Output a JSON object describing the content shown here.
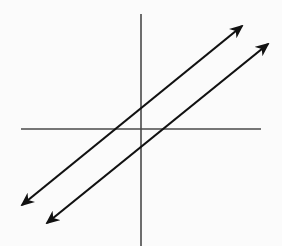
{
  "diagram": {
    "title": "Two parallel lines on coordinate axes",
    "colors": {
      "background": "#fbfbfb",
      "axis": "#4a4a4a",
      "line": "#111111"
    },
    "axes": {
      "x_axis": {
        "x1": 21,
        "y1": 129,
        "x2": 261,
        "y2": 129
      },
      "y_axis": {
        "x1": 141,
        "y1": 14,
        "x2": 141,
        "y2": 246
      }
    },
    "lines": [
      {
        "name": "line-a",
        "x1": 22,
        "y1": 205,
        "x2": 242,
        "y2": 26,
        "arrows": "both"
      },
      {
        "name": "line-b",
        "x1": 47,
        "y1": 223,
        "x2": 268,
        "y2": 44,
        "arrows": "both"
      }
    ]
  }
}
